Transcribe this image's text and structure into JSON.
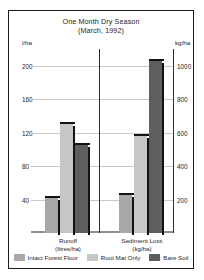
{
  "chart_data": {
    "type": "bar",
    "title": "One Month Dry Season",
    "subtitle": "(March, 1992)",
    "categories": [
      "Runoff",
      "Sediment Loss"
    ],
    "category_units": [
      "(litres/ha)",
      "(kg/ha)"
    ],
    "series": [
      {
        "name": "Intact Forest Floor",
        "color": "#a8a8a8",
        "values": [
          42,
          230
        ]
      },
      {
        "name": "Root Mat Only",
        "color": "#c6c6c6",
        "values": [
          130,
          580
        ]
      },
      {
        "name": "Bare Soil",
        "color": "#5e5e5e",
        "values": [
          105,
          1030
        ]
      }
    ],
    "left_axis": {
      "unit": "l/ha",
      "ticks": [
        200,
        160,
        120,
        80,
        40
      ],
      "min": 0,
      "max": 220
    },
    "right_axis": {
      "unit": "kg/ha",
      "ticks": [
        1000,
        800,
        600,
        400,
        200
      ],
      "min": 0,
      "max": 1100
    },
    "grid": true,
    "legend_position": "bottom",
    "xlabel": "",
    "ylabel": "l/ha"
  }
}
